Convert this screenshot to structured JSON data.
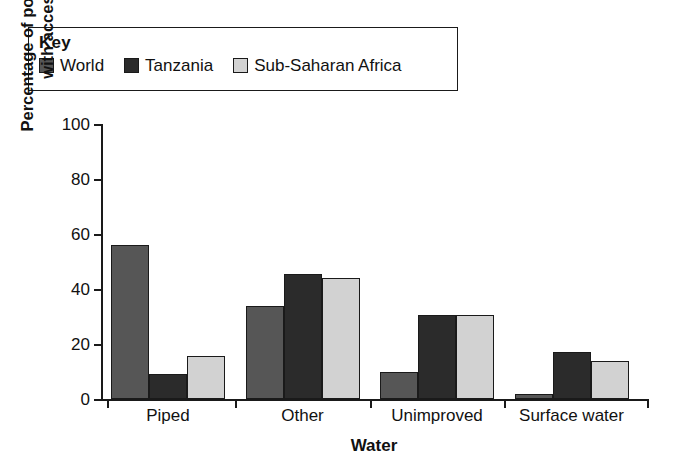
{
  "legend": {
    "title": "Key",
    "entries": [
      {
        "label": "World",
        "color": "#565656",
        "icon": "legend-swatch-world"
      },
      {
        "label": "Tanzania",
        "color": "#2b2b2b",
        "icon": "legend-swatch-tanzania"
      },
      {
        "label": "Sub-Saharan Africa",
        "color": "#d2d2d2",
        "icon": "legend-swatch-sub-saharan-africa"
      }
    ]
  },
  "chart_data": {
    "type": "bar",
    "title": "",
    "xlabel": "Water",
    "ylabel": "Percentage of population with access",
    "ylabel_line1": "Percentage of population",
    "ylabel_line2": "with access",
    "categories": [
      "Piped",
      "Other",
      "Unimproved",
      "Surface water"
    ],
    "series": [
      {
        "name": "World",
        "color": "#565656",
        "values": [
          56,
          34,
          10,
          2
        ]
      },
      {
        "name": "Tanzania",
        "color": "#2b2b2b",
        "values": [
          9,
          45.5,
          30.5,
          17
        ]
      },
      {
        "name": "Sub-Saharan Africa",
        "color": "#d2d2d2",
        "values": [
          15.5,
          44,
          30.5,
          14
        ]
      }
    ],
    "ylim": [
      0,
      100
    ],
    "yticks": [
      0,
      20,
      40,
      60,
      80,
      100
    ],
    "ytick_labels": [
      "0",
      "20",
      "40",
      "60",
      "80",
      "100"
    ],
    "grid": false,
    "legend_position": "top-left-box"
  }
}
